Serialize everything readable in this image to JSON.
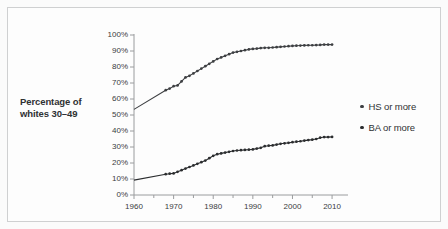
{
  "figure": {
    "background_color": "#fbfbfb",
    "frame_color": "#cfd0d1"
  },
  "axis_title": {
    "line1": "Percentage of",
    "line2": "whites 30–49"
  },
  "legend": {
    "position": "right",
    "entries": [
      {
        "label": "HS or more",
        "color": "#3d3f42",
        "marker": "dot"
      },
      {
        "label": "BA or more",
        "color": "#2b2d2f",
        "marker": "dot"
      }
    ]
  },
  "chart_data": {
    "type": "line",
    "title": "",
    "subtitle": "",
    "xlabel": "",
    "ylabel": "Percentage of whites 30–49",
    "xlim": [
      1960,
      2012
    ],
    "ylim": [
      0,
      100
    ],
    "grid": false,
    "legend_position": "right",
    "y_tick_labels": [
      "0%",
      "10%",
      "20%",
      "30%",
      "40%",
      "50%",
      "60%",
      "70%",
      "80%",
      "90%",
      "100%"
    ],
    "y_tick_values": [
      0,
      10,
      20,
      30,
      40,
      50,
      60,
      70,
      80,
      90,
      100
    ],
    "x_tick_labels": [
      "1960",
      "1970",
      "1980",
      "1990",
      "2000",
      "2010"
    ],
    "x_tick_values": [
      1960,
      1970,
      1980,
      1990,
      2000,
      2010
    ],
    "x_minor_tick_values": [
      1965,
      1975,
      1985,
      1995,
      2005
    ],
    "series": [
      {
        "name": "HS or more",
        "color": "#3d3f42",
        "marker": "dot",
        "x": [
          1960,
          1968,
          1969,
          1970,
          1971,
          1972,
          1973,
          1974,
          1975,
          1976,
          1977,
          1978,
          1979,
          1980,
          1981,
          1982,
          1983,
          1984,
          1985,
          1986,
          1987,
          1988,
          1989,
          1990,
          1991,
          1992,
          1993,
          1994,
          1995,
          1996,
          1997,
          1998,
          1999,
          2000,
          2001,
          2002,
          2003,
          2004,
          2005,
          2006,
          2007,
          2008,
          2009,
          2010
        ],
        "values": [
          53.5,
          65.5,
          66.5,
          68.0,
          68.5,
          71.0,
          73.5,
          74.5,
          76.0,
          77.5,
          79.0,
          80.5,
          82.0,
          83.5,
          85.0,
          86.0,
          87.0,
          88.0,
          89.0,
          89.5,
          90.0,
          90.5,
          91.0,
          91.3,
          91.5,
          91.8,
          92.0,
          92.0,
          92.2,
          92.4,
          92.6,
          92.8,
          93.0,
          93.2,
          93.3,
          93.4,
          93.5,
          93.6,
          93.6,
          93.7,
          93.8,
          94.0,
          94.0,
          94.0
        ]
      },
      {
        "name": "BA or more",
        "color": "#2b2d2f",
        "marker": "dot",
        "x": [
          1960,
          1968,
          1969,
          1970,
          1971,
          1972,
          1973,
          1974,
          1975,
          1976,
          1977,
          1978,
          1979,
          1980,
          1981,
          1982,
          1983,
          1984,
          1985,
          1986,
          1987,
          1988,
          1989,
          1990,
          1991,
          1992,
          1993,
          1994,
          1995,
          1996,
          1997,
          1998,
          1999,
          2000,
          2001,
          2002,
          2003,
          2004,
          2005,
          2006,
          2007,
          2008,
          2009,
          2010
        ],
        "values": [
          9.3,
          13.0,
          13.3,
          13.5,
          14.5,
          15.5,
          16.5,
          17.5,
          18.5,
          19.5,
          20.5,
          21.5,
          23.0,
          24.5,
          25.5,
          26.0,
          26.5,
          27.0,
          27.5,
          27.8,
          28.0,
          28.2,
          28.3,
          28.5,
          29.0,
          29.5,
          30.5,
          30.8,
          31.0,
          31.5,
          32.0,
          32.3,
          32.6,
          33.0,
          33.3,
          33.6,
          34.0,
          34.3,
          34.6,
          35.0,
          35.8,
          36.2,
          36.2,
          36.3
        ]
      }
    ]
  }
}
